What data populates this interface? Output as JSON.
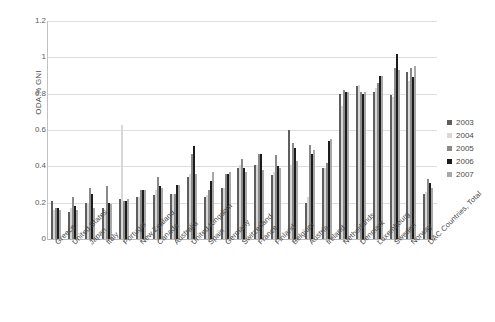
{
  "chart_data": {
    "type": "bar",
    "title": "",
    "xlabel": "",
    "ylabel": "ODA % GNI",
    "ylim": [
      0,
      1.2
    ],
    "yticks": [
      0,
      0.2,
      0.4,
      0.6,
      0.8,
      1,
      1.2
    ],
    "ytick_labels": [
      "0",
      "0.2",
      "0.4",
      "0.6",
      "0.8",
      "1",
      "1.2"
    ],
    "grid": true,
    "legend_position": "right",
    "legend": [
      "2003",
      "2004",
      "2005",
      "2006",
      "2007"
    ],
    "series_colors": [
      "#5e5e5e",
      "#d8d8d8",
      "#8a8a8a",
      "#1c1c1c",
      "#a8a8a8"
    ],
    "categories": [
      "Greece",
      "United States",
      "Japan",
      "Italy",
      "Portugal",
      "New Zealand",
      "Canada",
      "Australia",
      "United Kingdom",
      "Spain",
      "Germany",
      "Switzerland",
      "France",
      "Finland",
      "Belgium",
      "Austria",
      "Ireland",
      "Netherlands",
      "Denmark",
      "Luxembourg",
      "Sweden",
      "Norway",
      "DAC Countries, Total"
    ],
    "series": [
      {
        "name": "2003",
        "values": [
          0.21,
          0.15,
          0.2,
          0.17,
          0.22,
          0.23,
          0.24,
          0.25,
          0.34,
          0.23,
          0.28,
          0.39,
          0.41,
          0.35,
          0.6,
          0.2,
          0.39,
          0.8,
          0.84,
          0.81,
          0.79,
          0.92,
          0.25
        ]
      },
      {
        "name": "2004",
        "values": [
          0.16,
          0.17,
          0.19,
          0.15,
          0.63,
          0.23,
          0.27,
          0.25,
          0.36,
          0.24,
          0.28,
          0.41,
          0.41,
          0.37,
          0.41,
          0.23,
          0.39,
          0.73,
          0.85,
          0.83,
          0.78,
          0.87,
          0.26
        ]
      },
      {
        "name": "2005",
        "values": [
          0.17,
          0.23,
          0.28,
          0.29,
          0.21,
          0.27,
          0.34,
          0.25,
          0.47,
          0.27,
          0.36,
          0.44,
          0.47,
          0.46,
          0.53,
          0.52,
          0.42,
          0.82,
          0.81,
          0.86,
          0.94,
          0.94,
          0.33
        ]
      },
      {
        "name": "2006",
        "values": [
          0.17,
          0.18,
          0.25,
          0.2,
          0.21,
          0.27,
          0.29,
          0.3,
          0.51,
          0.32,
          0.36,
          0.39,
          0.47,
          0.4,
          0.5,
          0.47,
          0.54,
          0.81,
          0.8,
          0.9,
          1.02,
          0.89,
          0.31
        ]
      },
      {
        "name": "2007",
        "values": [
          0.16,
          0.16,
          0.17,
          0.19,
          0.22,
          0.27,
          0.28,
          0.3,
          0.36,
          0.37,
          0.37,
          0.37,
          0.38,
          0.39,
          0.43,
          0.49,
          0.55,
          0.81,
          0.81,
          0.9,
          0.93,
          0.95,
          0.28
        ]
      }
    ]
  }
}
